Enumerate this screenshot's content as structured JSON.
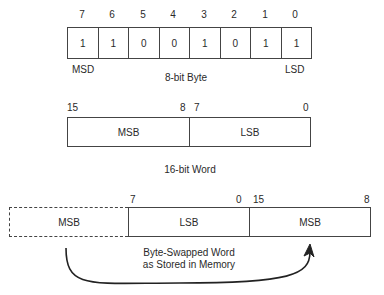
{
  "byte": {
    "bit_indices": [
      "7",
      "6",
      "5",
      "4",
      "3",
      "2",
      "1",
      "0"
    ],
    "bit_values": [
      "1",
      "1",
      "0",
      "0",
      "1",
      "0",
      "1",
      "1"
    ],
    "left_label": "MSD",
    "right_label": "LSD",
    "caption": "8-bit Byte"
  },
  "word": {
    "msb_high_index": "15",
    "msb_low_index": "8",
    "lsb_high_index": "7",
    "lsb_low_index": "0",
    "msb_label": "MSB",
    "lsb_label": "LSB",
    "caption": "16-bit Word"
  },
  "swapped": {
    "ghost_label": "MSB",
    "lsb_label": "LSB",
    "msb_label": "MSB",
    "lsb_high_index": "7",
    "lsb_low_index": "0",
    "msb_high_index": "15",
    "msb_low_index": "8",
    "caption_line1": "Byte-Swapped Word",
    "caption_line2": "as Stored in Memory"
  }
}
